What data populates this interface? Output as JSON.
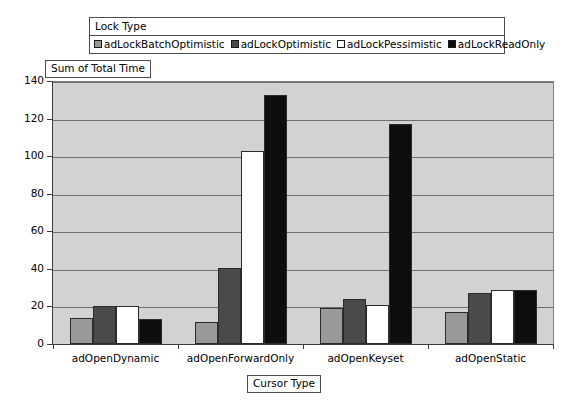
{
  "legend": {
    "title": "Lock Type",
    "entries": [
      {
        "label": "adLockBatchOptimistic",
        "color": "#999999"
      },
      {
        "label": "adLockOptimistic",
        "color": "#4a4a4a"
      },
      {
        "label": "adLockPessimistic",
        "color": "#ffffff"
      },
      {
        "label": "adLockReadOnly",
        "color": "#0d0d0d"
      }
    ]
  },
  "axis_titles": {
    "y": "Sum of Total Time",
    "x": "Cursor Type"
  },
  "chart_data": {
    "type": "bar",
    "title": "",
    "subtitle": "",
    "xlabel": "Cursor Type",
    "ylabel": "Sum of Total Time",
    "ylim": [
      0,
      140
    ],
    "yticks": [
      0,
      20,
      40,
      60,
      80,
      100,
      120,
      140
    ],
    "ytick_labels": [
      "0",
      "20",
      "40",
      "60",
      "80",
      "100",
      "120",
      "140"
    ],
    "grid": true,
    "legend_position": "top",
    "legend_title": "Lock Type",
    "categories": [
      "adOpenDynamic",
      "adOpenForwardOnly",
      "adOpenKeyset",
      "adOpenStatic"
    ],
    "series": [
      {
        "name": "adLockBatchOptimistic",
        "color": "#999999",
        "values": [
          14,
          11.5,
          19,
          17
        ]
      },
      {
        "name": "adLockOptimistic",
        "color": "#4a4a4a",
        "values": [
          20,
          40.5,
          24,
          27
        ]
      },
      {
        "name": "adLockPessimistic",
        "color": "#ffffff",
        "values": [
          20,
          103,
          21,
          28.5
        ]
      },
      {
        "name": "adLockReadOnly",
        "color": "#0d0d0d",
        "values": [
          13.5,
          132.5,
          117,
          28.5
        ]
      }
    ],
    "plot_background": "#d2d2d2",
    "gridline_color": "#6e6e6e",
    "axis_color": "#3d3d3d",
    "bar_border_color": "#2b2b2b"
  }
}
